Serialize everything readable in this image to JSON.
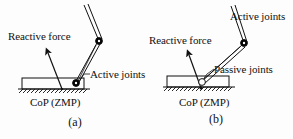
{
  "figure": {
    "background_color": "#fdfdfd",
    "stroke_color": "#111111",
    "joint_fill_color": "#000000",
    "joint_open_fill_color": "#ffffff"
  },
  "panels": [
    {
      "id": "a",
      "caption": "(a)",
      "labels": {
        "reactive_force": "Reactive force",
        "joints": "Active joints",
        "cop": "CoP (ZMP)"
      },
      "joints": [
        {
          "name": "knee-joint",
          "style": "filled",
          "x": 99,
          "y": 41
        },
        {
          "name": "ankle-joint",
          "style": "filled",
          "x": 75,
          "y": 84
        }
      ],
      "force_arrow": {
        "from_x": 62,
        "from_y": 89,
        "to_x": 48,
        "to_y": 53
      },
      "foot": {
        "x": 22,
        "y": 78,
        "width": 62,
        "height": 11
      },
      "ground": {
        "x": 18,
        "y": 89,
        "width": 72
      }
    },
    {
      "id": "b",
      "caption": "(b)",
      "labels": {
        "reactive_force": "Reactive force",
        "joints": "Active joints",
        "passive_joints": "Passive joints",
        "cop": "CoP (ZMP)"
      },
      "joints": [
        {
          "name": "knee-joint",
          "style": "filled",
          "x": 97,
          "y": 43
        },
        {
          "name": "ankle-joint",
          "style": "open",
          "x": 54,
          "y": 83
        }
      ],
      "force_arrow": {
        "from_x": 54,
        "from_y": 88,
        "to_x": 42,
        "to_y": 55
      },
      "foot": {
        "x": 20,
        "y": 76,
        "width": 62,
        "height": 11
      },
      "ground": {
        "x": 16,
        "y": 87,
        "width": 72
      }
    }
  ]
}
